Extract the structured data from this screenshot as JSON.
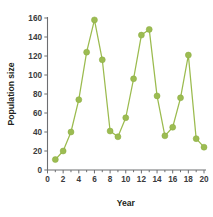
{
  "chart_data": {
    "type": "line",
    "title": "",
    "xlabel": "Year",
    "ylabel": "Population size",
    "xlim": [
      0,
      20
    ],
    "ylim": [
      0,
      160
    ],
    "grid": false,
    "legend": null,
    "x_ticks": [
      0,
      2,
      4,
      6,
      8,
      10,
      12,
      14,
      16,
      18,
      20
    ],
    "x_tick_labels": [
      "0",
      "2",
      "4",
      "6",
      "8",
      "10",
      "12",
      "14",
      "16",
      "18",
      "20"
    ],
    "x_minor_ticks": [
      1,
      3,
      5,
      7,
      9,
      11,
      13,
      15,
      17,
      19
    ],
    "y_ticks": [
      0,
      20,
      40,
      60,
      80,
      100,
      120,
      140,
      160
    ],
    "y_tick_labels": [
      "0",
      "20",
      "40",
      "60",
      "80",
      "100",
      "120",
      "140",
      "160"
    ],
    "marker": "circle",
    "marker_color": "#9cbc52",
    "line_color": "#9bbb4e",
    "x": [
      1,
      2,
      3,
      4,
      5,
      6,
      7,
      8,
      9,
      10,
      11,
      12,
      13,
      14,
      15,
      16,
      17,
      18,
      19,
      20
    ],
    "values": [
      11,
      20,
      40,
      74,
      124,
      158,
      116,
      41,
      35,
      55,
      96,
      142,
      148,
      78,
      36,
      45,
      76,
      121,
      33,
      24
    ],
    "series": [
      {
        "name": "Population size",
        "values": [
          11,
          20,
          40,
          74,
          124,
          158,
          116,
          41,
          35,
          55,
          96,
          142,
          148,
          78,
          36,
          45,
          76,
          121,
          33,
          24
        ]
      }
    ]
  }
}
